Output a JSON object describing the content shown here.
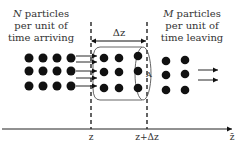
{
  "left_text": {
    "line1_var": "N",
    "line1_rest": " particles",
    "line2": "per unit of",
    "line3": "time arriving"
  },
  "right_text": {
    "line1_var": "M",
    "line1_rest": " particles",
    "line2": "per unit of",
    "line3": "time leaving"
  },
  "delta_label": "Δz",
  "area_label": "A",
  "axis": {
    "tick_left": "z",
    "tick_right": "z+Δz",
    "axis_label": "z̄"
  },
  "colors": {
    "ink": "#111111",
    "text": "#333333",
    "background": "#ffffff"
  }
}
